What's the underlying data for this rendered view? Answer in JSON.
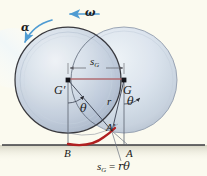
{
  "figure": {
    "kind": "physics-diagram",
    "background_color": "#fbfaef",
    "ground_line_color": "#3a3a3f",
    "disk_outline_color": "#2b2b31",
    "disk_fill_light": "#e7edf4",
    "disk_fill_mid": "#c3cedd",
    "disk_fill_dark": "#a9b6c8",
    "arc_color": "#b01f20",
    "dimension_color": "#b06c72",
    "arrow_color": "#4f9bd2",
    "label_color": "#1b1b20"
  },
  "labels": {
    "alpha": "α",
    "omega": "ω",
    "center_left": "G",
    "center_left_prime": "′",
    "center_right": "G",
    "dimension_sG_base": "s",
    "dimension_sG_sub": "G",
    "radius": "r",
    "theta_left": "θ",
    "theta_right": "θ",
    "contact_point_moved": "A",
    "contact_point_moved_prime": "′",
    "contact_point_B": "B",
    "contact_point_A": "A",
    "equation_lhs_base": "s",
    "equation_lhs_sub": "G",
    "equation_op": "=",
    "equation_rhs": "rθ"
  },
  "geometry": {
    "disk_radius_px": 53,
    "left_center": {
      "x": 68,
      "y": 80
    },
    "right_center": {
      "x": 124,
      "y": 80
    },
    "ground_y": 145,
    "contact_B": {
      "x": 68,
      "y": 145
    },
    "contact_A": {
      "x": 124,
      "y": 145
    },
    "point_A_prime": {
      "x": 113,
      "y": 128
    },
    "sG_length_px": 56
  },
  "annotations": {
    "omega_direction": "counterclockwise (arrow pointing left along top)",
    "alpha_direction": "counterclockwise (curved arrow at upper-left rim)",
    "equation": "s_G = rθ"
  }
}
